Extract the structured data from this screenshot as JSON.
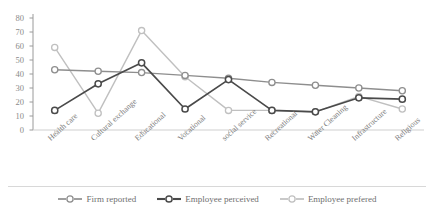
{
  "chart_data": {
    "type": "line",
    "title": "",
    "xlabel": "",
    "ylabel": "",
    "ylim": [
      0,
      80
    ],
    "yticks": [
      0,
      10,
      20,
      30,
      40,
      50,
      60,
      70,
      80
    ],
    "grid": false,
    "legend_position": "bottom",
    "categories": [
      "Health care",
      "Cultural exchange",
      "Educational",
      "Vocational",
      "social service",
      "Recreational",
      "Water Cleaning",
      "Infrastructure",
      "Religious"
    ],
    "series": [
      {
        "name": "Firm reported",
        "color": "#8e8e8e",
        "marker": "circle",
        "values": [
          43,
          42,
          41,
          39,
          37,
          34,
          32,
          30,
          28
        ]
      },
      {
        "name": "Employee perceived",
        "color": "#4a4a4a",
        "marker": "circle",
        "values": [
          14,
          33,
          48,
          15,
          36,
          14,
          13,
          23,
          22
        ]
      },
      {
        "name": "Employee prefered",
        "color": "#c0c0c0",
        "marker": "circle",
        "values": [
          59,
          12,
          71,
          38,
          14,
          14,
          13,
          24,
          15
        ]
      }
    ]
  },
  "legend": {
    "items": [
      {
        "label": "Firm reported"
      },
      {
        "label": "Employee perceived"
      },
      {
        "label": "Employee prefered"
      }
    ]
  },
  "axis": {
    "y_tick_labels": [
      "80",
      "70",
      "60",
      "50",
      "40",
      "30",
      "20",
      "10",
      "0"
    ]
  }
}
